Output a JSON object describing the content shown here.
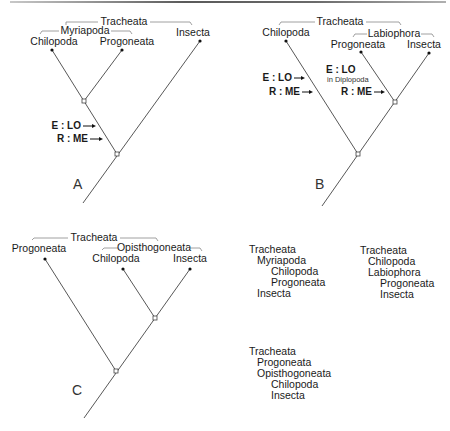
{
  "trees": [
    {
      "id": "A",
      "panel_label": "A",
      "groups": [
        {
          "name": "Tracheata",
          "members": [
            "Chilopoda",
            "Progoneata",
            "Insecta"
          ]
        },
        {
          "name": "Myriapoda",
          "members": [
            "Chilopoda",
            "Progoneata"
          ]
        }
      ],
      "taxa": [
        "Chilopoda",
        "Progoneata",
        "Insecta"
      ],
      "topology": "((Chilopoda, Progoneata), Insecta)",
      "annotations": [
        {
          "text": "E : LO",
          "detail": ""
        },
        {
          "text": "R : ME",
          "detail": ""
        }
      ]
    },
    {
      "id": "B",
      "panel_label": "B",
      "groups": [
        {
          "name": "Tracheata",
          "members": [
            "Chilopoda",
            "Progoneata",
            "Insecta"
          ]
        },
        {
          "name": "Labiophora",
          "members": [
            "Progoneata",
            "Insecta"
          ]
        }
      ],
      "taxa": [
        "Chilopoda",
        "Progoneata",
        "Insecta"
      ],
      "topology": "(Chilopoda, (Progoneata, Insecta))",
      "annotations": [
        {
          "text": "E : LO",
          "detail": ""
        },
        {
          "text": "R : ME",
          "detail": ""
        },
        {
          "text": "E : LO",
          "detail": "in Diplopoda"
        },
        {
          "text": "R : ME",
          "detail": ""
        }
      ]
    },
    {
      "id": "C",
      "panel_label": "C",
      "groups": [
        {
          "name": "Tracheata",
          "members": [
            "Progoneata",
            "Chilopoda",
            "Insecta"
          ]
        },
        {
          "name": "Opisthogoneata",
          "members": [
            "Chilopoda",
            "Insecta"
          ]
        }
      ],
      "taxa": [
        "Progoneata",
        "Chilopoda",
        "Insecta"
      ],
      "topology": "(Progoneata, (Chilopoda, Insecta))",
      "annotations": []
    }
  ],
  "classifications": [
    {
      "for": "A",
      "lines": [
        {
          "text": "Tracheata",
          "level": 0
        },
        {
          "text": "Myriapoda",
          "level": 1
        },
        {
          "text": "Chilopoda",
          "level": 2
        },
        {
          "text": "Progoneata",
          "level": 2
        },
        {
          "text": "Insecta",
          "level": 1
        }
      ]
    },
    {
      "for": "B",
      "lines": [
        {
          "text": "Tracheata",
          "level": 0
        },
        {
          "text": "Chilopoda",
          "level": 1
        },
        {
          "text": "Labiophora",
          "level": 1
        },
        {
          "text": "Progoneata",
          "level": 2
        },
        {
          "text": "Insecta",
          "level": 2
        }
      ]
    },
    {
      "for": "C",
      "lines": [
        {
          "text": "Tracheata",
          "level": 0
        },
        {
          "text": "Progoneata",
          "level": 1
        },
        {
          "text": "Opisthogoneata",
          "level": 1
        },
        {
          "text": "Chilopoda",
          "level": 2
        },
        {
          "text": "Insecta",
          "level": 2
        }
      ]
    }
  ]
}
